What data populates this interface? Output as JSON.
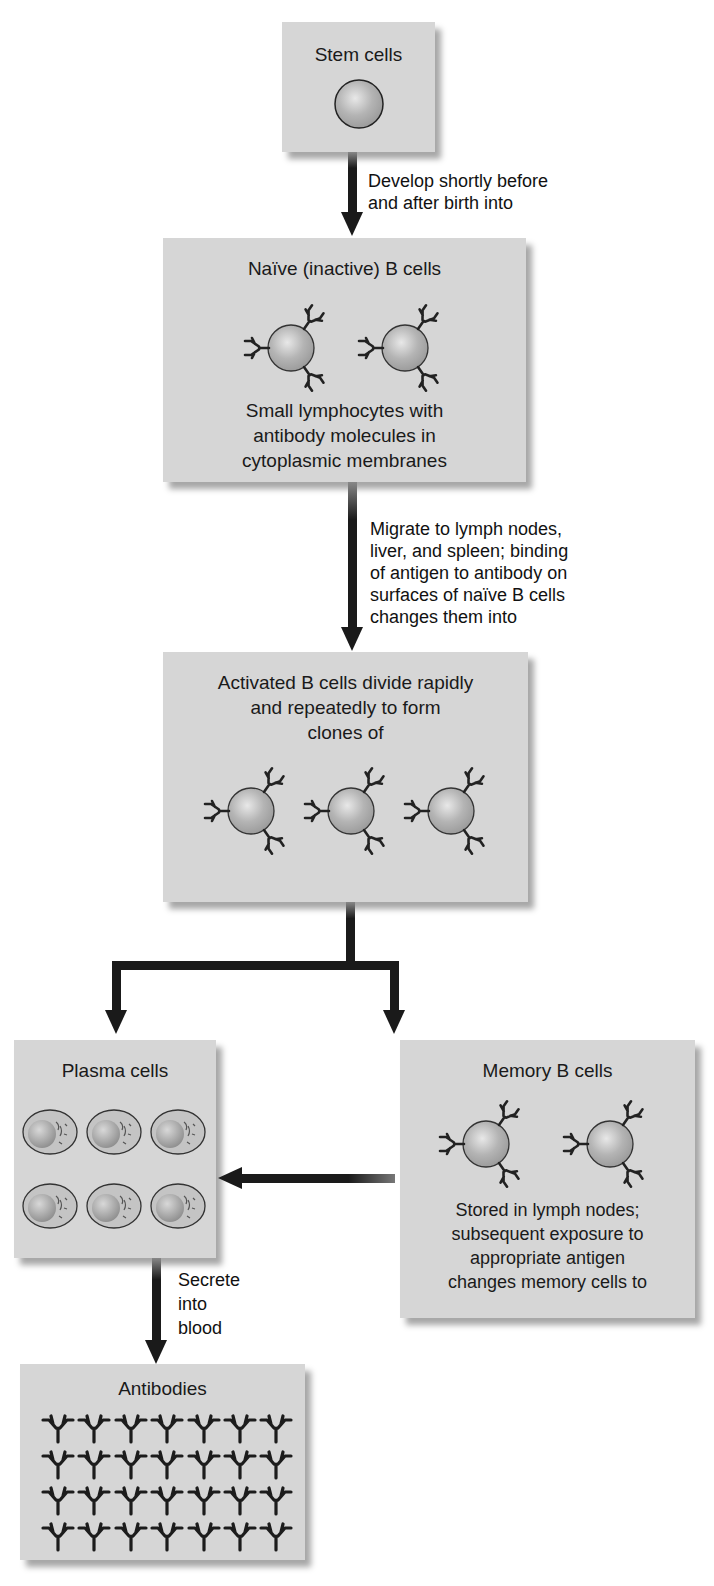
{
  "diagram": {
    "type": "flowchart",
    "colors": {
      "box_fill": "#d6d6d6",
      "arrow": "#1a1a1a",
      "cell_fill": "#b5b5b5",
      "antibody": "#222222"
    },
    "nodes": {
      "stem_cells": {
        "title": "Stem cells"
      },
      "naive_b_cells": {
        "title": "Naïve (inactive) B cells",
        "description": [
          "Small lymphocytes with",
          "antibody molecules in",
          "cytoplasmic membranes"
        ]
      },
      "activated_b_cells": {
        "title_lines": [
          "Activated B cells divide rapidly",
          "and repeatedly to form",
          "clones of"
        ]
      },
      "plasma_cells": {
        "title": "Plasma cells"
      },
      "memory_b_cells": {
        "title": "Memory B cells",
        "description": [
          "Stored in lymph nodes;",
          "subsequent exposure to",
          "appropriate antigen",
          "changes memory cells to"
        ]
      },
      "antibodies": {
        "title": "Antibodies"
      }
    },
    "edges": {
      "stem_to_naive": {
        "label": [
          "Develop shortly before",
          "and after birth into"
        ]
      },
      "naive_to_activated": {
        "label": [
          "Migrate to lymph nodes,",
          "liver, and spleen; binding",
          "of antigen to antibody on",
          "surfaces of naïve B cells",
          "changes them into"
        ]
      },
      "activated_to_plasma_and_memory": {
        "label": ""
      },
      "memory_to_plasma": {
        "label": ""
      },
      "plasma_to_antibodies": {
        "label": [
          "Secrete",
          "into",
          "blood"
        ]
      }
    },
    "counts": {
      "stem_cells_shown": 1,
      "naive_cells_shown": 2,
      "activated_cells_shown": 3,
      "plasma_cells_shown": 6,
      "memory_cells_shown": 2,
      "antibody_rows": 4,
      "antibody_columns": 7
    }
  }
}
